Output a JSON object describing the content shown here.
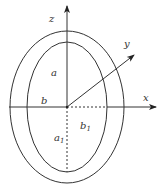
{
  "diagram": {
    "center": {
      "x": 67,
      "y": 107
    },
    "outer_ellipse": {
      "rx": 57,
      "ry": 76
    },
    "inner_ellipse": {
      "rx": 40,
      "ry": 65
    },
    "axes": {
      "x": {
        "label": "x"
      },
      "y": {
        "label": "y"
      },
      "z": {
        "label": "z"
      }
    },
    "labels": {
      "a": "a",
      "b": "b",
      "a1_main": "a",
      "a1_sub": "1",
      "b1_main": "b",
      "b1_sub": "1"
    },
    "colors": {
      "stroke": "#333333",
      "background": "#ffffff"
    }
  }
}
